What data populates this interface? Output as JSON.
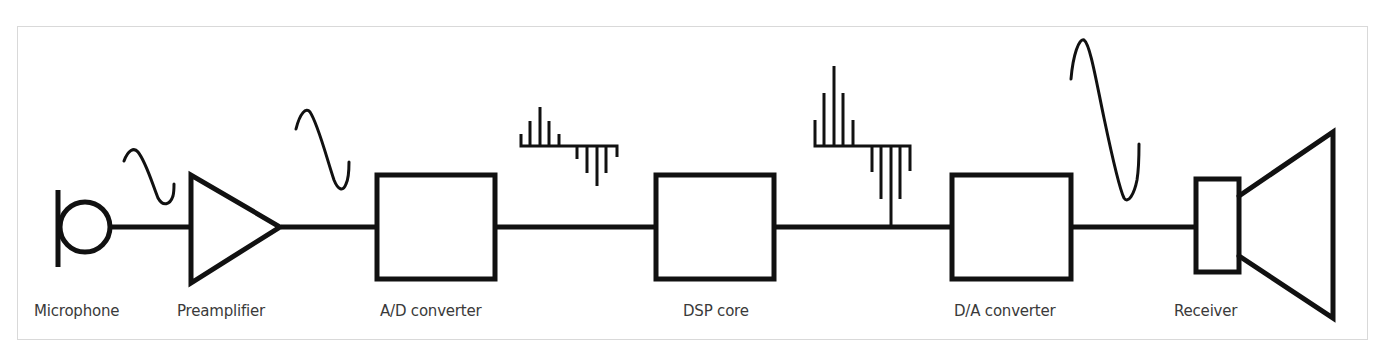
{
  "diagram": {
    "title": "",
    "colors": {
      "stroke": "#111111",
      "frame": "#d9d9d9",
      "label": "#3a3a3a",
      "background": "#ffffff"
    },
    "blocks": [
      {
        "id": "microphone",
        "label": "Microphone",
        "shape": "microphone-symbol"
      },
      {
        "id": "preamplifier",
        "label": "Preamplifier",
        "shape": "triangle"
      },
      {
        "id": "ad-converter",
        "label": "A/D converter",
        "shape": "box"
      },
      {
        "id": "dsp-core",
        "label": "DSP core",
        "shape": "box"
      },
      {
        "id": "da-converter",
        "label": "D/A converter",
        "shape": "box"
      },
      {
        "id": "receiver",
        "label": "Receiver",
        "shape": "speaker-symbol"
      }
    ],
    "signals": [
      {
        "between": [
          "microphone",
          "preamplifier"
        ],
        "type": "small analog sine wave"
      },
      {
        "between": [
          "preamplifier",
          "ad-converter"
        ],
        "type": "amplified analog sine wave"
      },
      {
        "between": [
          "ad-converter",
          "dsp-core"
        ],
        "type": "small sampled (digital) signal"
      },
      {
        "between": [
          "dsp-core",
          "da-converter"
        ],
        "type": "amplified sampled (digital) signal"
      },
      {
        "between": [
          "da-converter",
          "receiver"
        ],
        "type": "large analog sine wave"
      }
    ],
    "connections": [
      [
        "microphone",
        "preamplifier"
      ],
      [
        "preamplifier",
        "ad-converter"
      ],
      [
        "ad-converter",
        "dsp-core"
      ],
      [
        "dsp-core",
        "da-converter"
      ],
      [
        "da-converter",
        "receiver"
      ]
    ]
  }
}
